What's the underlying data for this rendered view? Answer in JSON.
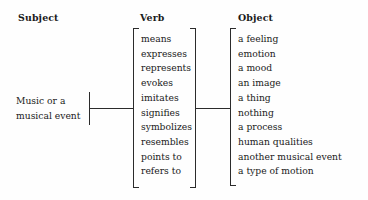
{
  "diagram": {
    "ink_color": "#2b2b2b",
    "background_color": "#fefefe",
    "headers": {
      "subject": "Subject",
      "verb": "Verb",
      "object": "Object"
    },
    "subject": {
      "line1": "Music or a",
      "line2": "musical event"
    },
    "verbs": [
      "means",
      "expresses",
      "represents",
      "evokes",
      "imitates",
      "signifies",
      "symbolizes",
      "resembles",
      "points to",
      "refers to"
    ],
    "objects": [
      "a feeling",
      "emotion",
      "a mood",
      "an image",
      "a thing",
      "nothing",
      "a process",
      "human qualities",
      "another musical event",
      "a type of motion"
    ]
  }
}
